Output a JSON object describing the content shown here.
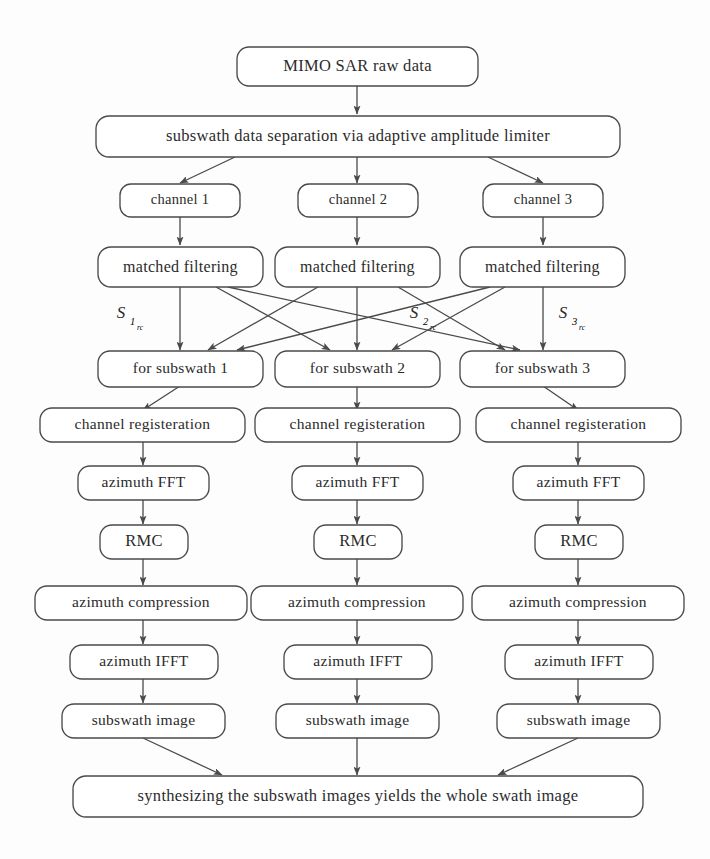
{
  "diagram": {
    "type": "flowchart",
    "orientation": "top-to-bottom",
    "colors": {
      "background": "#fdfdfd",
      "box_fill": "#ffffff",
      "box_stroke": "#4a4a4a",
      "text": "#2b2b2b",
      "arrow": "#4a4a4a"
    },
    "nodes": {
      "raw_data": "MIMO SAR raw data",
      "separation": "subswath data separation via adaptive amplitude limiter",
      "channel_1": "channel 1",
      "channel_2": "channel 2",
      "channel_3": "channel 3",
      "matched_filtering_1": "matched filtering",
      "matched_filtering_2": "matched filtering",
      "matched_filtering_3": "matched filtering",
      "for_subswath_1": "for subswath 1",
      "for_subswath_2": "for subswath 2",
      "for_subswath_3": "for subswath 3",
      "channel_registeration_1": "channel registeration",
      "channel_registeration_2": "channel registeration",
      "channel_registeration_3": "channel registeration",
      "azimuth_fft_1": "azimuth FFT",
      "azimuth_fft_2": "azimuth FFT",
      "azimuth_fft_3": "azimuth FFT",
      "rmc_1": "RMC",
      "rmc_2": "RMC",
      "rmc_3": "RMC",
      "azimuth_compression_1": "azimuth compression",
      "azimuth_compression_2": "azimuth compression",
      "azimuth_compression_3": "azimuth compression",
      "azimuth_ifft_1": "azimuth IFFT",
      "azimuth_ifft_2": "azimuth IFFT",
      "azimuth_ifft_3": "azimuth IFFT",
      "subswath_image_1": "subswath image",
      "subswath_image_2": "subswath image",
      "subswath_image_3": "subswath image",
      "synthesis": "synthesizing the subswath images yields the whole swath image"
    },
    "signal_labels": [
      {
        "base": "S",
        "sub": "1",
        "subsub": "rc"
      },
      {
        "base": "S",
        "sub": "2",
        "subsub": "rc"
      },
      {
        "base": "S",
        "sub": "3",
        "subsub": "rc"
      }
    ]
  }
}
